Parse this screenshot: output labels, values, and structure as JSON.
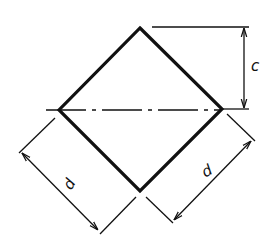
{
  "diagram": {
    "type": "technical-drawing",
    "colors": {
      "line": "#111111",
      "background": "#ffffff"
    },
    "labels": {
      "height_label": "c",
      "side_left_label": "d",
      "side_right_label": "d"
    },
    "shape": {
      "vertices": {
        "top": [
          140,
          28
        ],
        "right": [
          222,
          109
        ],
        "bottom": [
          140,
          191
        ],
        "left": [
          59,
          110
        ]
      }
    },
    "dimensions": [
      {
        "name": "c",
        "meaning": "vertical distance from top vertex to centerline"
      },
      {
        "name": "d",
        "meaning": "side length (lower-left edge)"
      },
      {
        "name": "d",
        "meaning": "side length (lower-right edge)"
      }
    ]
  }
}
